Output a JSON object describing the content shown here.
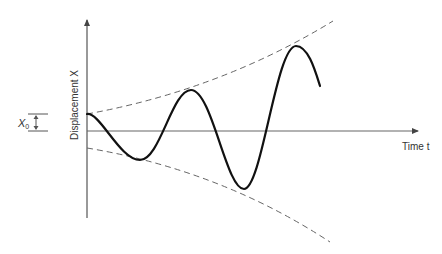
{
  "diagram": {
    "y_axis_label": "Displacement X",
    "x_axis_label": "Time t",
    "amplitude_label": "X0",
    "amplitude_label_main": "X",
    "amplitude_label_sub": "0",
    "colors": {
      "curve": "#111111",
      "axis": "#555555",
      "envelope": "#666666"
    },
    "curve_points": [
      [
        87,
        114
      ],
      [
        140,
        160
      ],
      [
        191,
        90
      ],
      [
        244,
        189
      ],
      [
        296,
        46
      ],
      [
        320,
        86
      ]
    ],
    "envelope_upper": {
      "start": [
        87,
        114
      ],
      "end": [
        333,
        21
      ],
      "style": "dashed"
    },
    "envelope_lower": {
      "start": [
        87,
        148
      ],
      "end": [
        330,
        242
      ],
      "style": "dashed"
    }
  }
}
